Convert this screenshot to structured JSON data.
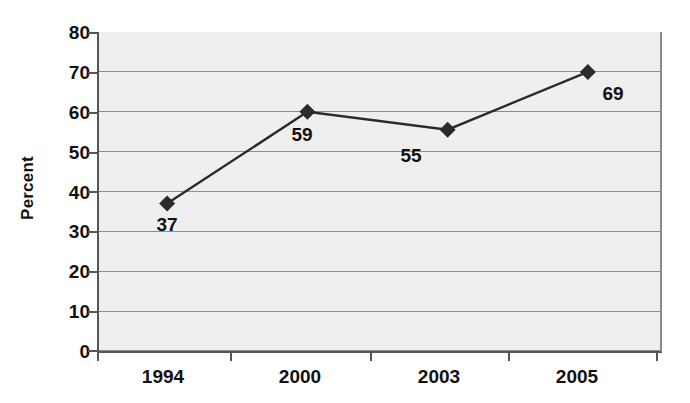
{
  "chart_data": {
    "type": "line",
    "title": "",
    "xlabel": "",
    "ylabel": "Percent",
    "categories": [
      "1994",
      "2000",
      "2003",
      "2005"
    ],
    "values": [
      37,
      59,
      55,
      69
    ],
    "point_labels": [
      "37",
      "59",
      "55",
      "69"
    ],
    "plotted_values": [
      37,
      60,
      55.5,
      70
    ],
    "ylim": [
      0,
      80
    ],
    "ytick_labels": [
      "80",
      "70",
      "60",
      "50",
      "40",
      "30",
      "20",
      "10",
      "0"
    ],
    "ytick_values": [
      80,
      70,
      60,
      50,
      40,
      30,
      20,
      10,
      0
    ],
    "grid": true,
    "legend": "none",
    "marker": "diamond",
    "colors": {
      "line": "#2b2b2b",
      "marker": "#2b2b2b",
      "plot_background": "#efefef",
      "gridline": "#8d8d8d",
      "axis": "#555555",
      "text": "#111111",
      "page_background": "#ffffff"
    }
  }
}
